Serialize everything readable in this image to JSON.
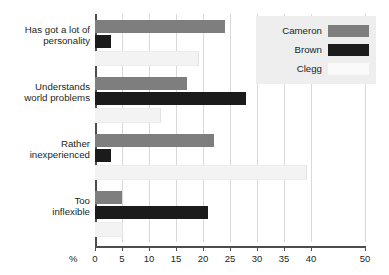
{
  "chart_data": {
    "type": "bar",
    "orientation": "horizontal",
    "title": "",
    "subtitle": "",
    "xlabel": "%",
    "ylabel": "",
    "xlim": [
      0,
      50
    ],
    "xticks": [
      0,
      5,
      10,
      15,
      20,
      25,
      30,
      35,
      40,
      50
    ],
    "grid": true,
    "legend_position": "top-right",
    "categories": [
      "Has got a lot of personality",
      "Understands world problems",
      "Rather inexperienced",
      "Too inflexible"
    ],
    "category_lines": [
      [
        "Has got a lot of",
        "personality"
      ],
      [
        "Understands",
        "world problems"
      ],
      [
        "Rather",
        "inexperienced"
      ],
      [
        "Too",
        "inflexible"
      ]
    ],
    "series": [
      {
        "name": "Cameron",
        "color": "#7e7e7e",
        "values": [
          24,
          17,
          22,
          5
        ]
      },
      {
        "name": "Brown",
        "color": "#1b1b1b",
        "values": [
          3,
          28,
          3,
          21
        ]
      },
      {
        "name": "Clegg",
        "color": "#f3f3f3",
        "values": [
          19,
          12,
          39,
          5
        ]
      }
    ]
  },
  "legend": {
    "entries": [
      {
        "label": "Cameron"
      },
      {
        "label": "Brown"
      },
      {
        "label": "Clegg"
      }
    ]
  },
  "axis": {
    "unit_label": "%",
    "tick_labels": [
      "0",
      "5",
      "10",
      "15",
      "20",
      "25",
      "30",
      "35",
      "40",
      "50"
    ]
  }
}
